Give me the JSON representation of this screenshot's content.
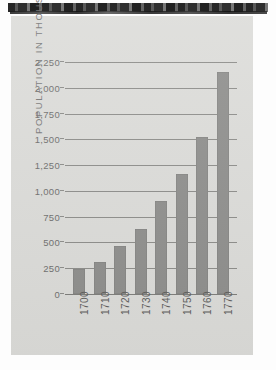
{
  "chart_data": {
    "type": "bar",
    "title": "",
    "subtitle": "",
    "xlabel": "",
    "ylabel": "POPULATION IN THOUSANDS",
    "categories": [
      "1700",
      "1710",
      "1720",
      "1730",
      "1740",
      "1750",
      "1760",
      "1770"
    ],
    "values": [
      240,
      315,
      470,
      630,
      900,
      1160,
      1525,
      2150
    ],
    "series": [
      {
        "name": "Population",
        "values": [
          240,
          315,
          470,
          630,
          900,
          1160,
          1525,
          2150
        ]
      }
    ],
    "ylim": [
      0,
      2250
    ],
    "ytick_labels": [
      "0",
      "250",
      "500",
      "750",
      "1,000",
      "1,250",
      "1,500",
      "1,750",
      "2,000",
      "2,250"
    ],
    "ytick_values": [
      0,
      250,
      500,
      750,
      1000,
      1250,
      1500,
      1750,
      2000,
      2250
    ],
    "grid": true,
    "grid_axis": "y",
    "legend": false,
    "legend_position": "none",
    "bar_color": "#8f8f8d",
    "gridline_color": "#8d8d8a",
    "plot_background": "#dcdcd9",
    "text_color": "#6f6f6e",
    "xtick_rotation": -90
  },
  "page": {
    "background": "#dcdcd9",
    "surround": "#fdfdfd",
    "scan_edge_color": "#141414"
  }
}
